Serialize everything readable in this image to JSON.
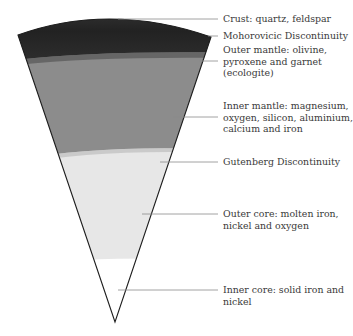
{
  "diagram": {
    "colors": {
      "crust": "#2a2a2a",
      "mantle": "#8c8c8c",
      "outer_core": "#e7e7e7",
      "inner_core": "#ffffff",
      "outline": "#1e1e1e",
      "leader_line": "#8a8a8a",
      "text": "#3a3a3a"
    },
    "labels": [
      {
        "id": "crust",
        "line1": "Crust: quartz, feldspar",
        "line2": "",
        "line3": ""
      },
      {
        "id": "moho",
        "line1": "Mohorovicic Discontinuity",
        "line2": "",
        "line3": ""
      },
      {
        "id": "outer-mantle",
        "line1": "Outer mantle: olivine,",
        "line2": "pyroxene and garnet",
        "line3": "(ecologite)"
      },
      {
        "id": "inner-mantle",
        "line1": "Inner mantle: magnesium,",
        "line2": "oxygen, silicon, aluminium,",
        "line3": "calcium and iron"
      },
      {
        "id": "gutenberg",
        "line1": "Gutenberg Discontinuity",
        "line2": "",
        "line3": ""
      },
      {
        "id": "outer-core",
        "line1": "Outer core: molten iron,",
        "line2": "nickel and oxygen",
        "line3": ""
      },
      {
        "id": "inner-core",
        "line1": "Inner core: solid iron and",
        "line2": "nickel",
        "line3": ""
      }
    ]
  }
}
